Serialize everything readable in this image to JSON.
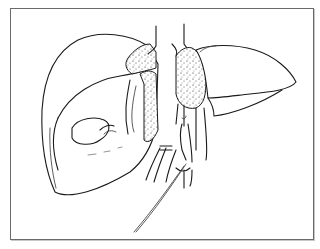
{
  "figure": {
    "type": "anatomical line illustration",
    "colors": {
      "background": "#ffffff",
      "line": "#1a1a1a",
      "frame": "#6a6a6a"
    },
    "parts": [
      {
        "id": "left-lobe",
        "description": "large right hepatic lobe, rounded outline"
      },
      {
        "id": "inner-lobe",
        "description": "inner lobe segment with oval structure"
      },
      {
        "id": "oval-structure",
        "description": "oval gallbladder-like shape"
      },
      {
        "id": "right-lobe",
        "description": "elongated left hepatic lobe"
      },
      {
        "id": "stippled-area-left",
        "description": "stippled tissue near upper center left"
      },
      {
        "id": "stippled-area-right",
        "description": "stippled tissue near upper center right"
      },
      {
        "id": "upper-vessels",
        "description": "two vertical vessels at top center"
      },
      {
        "id": "lower-vessels",
        "description": "tubular vessels and ligature at bottom center"
      },
      {
        "id": "suture-thread",
        "description": "long thin thread extending down-left"
      }
    ]
  }
}
